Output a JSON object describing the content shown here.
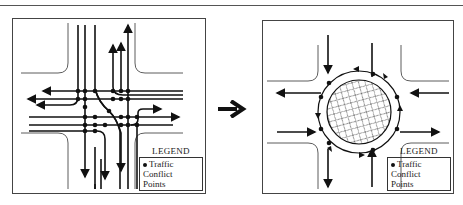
{
  "figure": {
    "transition_icon": "right-arrow-icon",
    "panels": [
      {
        "id": "intersection",
        "label": "Conventional intersection",
        "conflict_points": 32,
        "legend": {
          "title": "LEGEND",
          "symbol": "filled-dot",
          "entry_line1": "Traffic Conflict",
          "entry_line2": "Points"
        }
      },
      {
        "id": "roundabout",
        "label": "Roundabout",
        "conflict_points": 8,
        "legend": {
          "title": "LEGEND",
          "symbol": "filled-dot",
          "entry_line1": "Traffic Conflict",
          "entry_line2": "Points"
        }
      }
    ]
  },
  "colors": {
    "line": "#111111",
    "frame": "#444444",
    "background": "#ffffff"
  }
}
